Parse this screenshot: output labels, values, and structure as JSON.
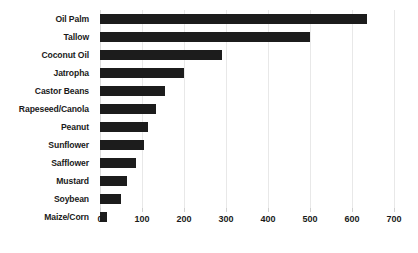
{
  "chart": {
    "type": "bar",
    "orientation": "horizontal",
    "bar_color": "#1c1c1c",
    "grid_color": "#e8e8e8"
  },
  "chart_data": {
    "type": "bar",
    "title": "",
    "xlabel": "",
    "ylabel": "",
    "categories": [
      "Oil Palm",
      "Tallow",
      "Coconut Oil",
      "Jatropha",
      "Castor Beans",
      "Rapeseed/Canola",
      "Peanut",
      "Sunflower",
      "Safflower",
      "Mustard",
      "Soybean",
      "Maize/Corn"
    ],
    "values": [
      635,
      500,
      290,
      200,
      155,
      133,
      115,
      105,
      85,
      65,
      50,
      17
    ],
    "xlim": [
      0,
      700
    ],
    "xticks": [
      0,
      100,
      200,
      300,
      400,
      500,
      600,
      700
    ],
    "xtick_labels": [
      "0",
      "100",
      "200",
      "300",
      "400",
      "500",
      "600",
      "700"
    ],
    "grid": true,
    "grid_axis": "x",
    "legend": false,
    "legend_position": "none"
  }
}
